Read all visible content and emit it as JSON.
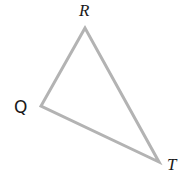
{
  "diagram": {
    "type": "triangle",
    "stroke_color": "#b3b3b3",
    "stroke_width": 3,
    "vertices": [
      {
        "name": "R",
        "x": 85,
        "y": 28
      },
      {
        "name": "Q",
        "x": 41,
        "y": 106
      },
      {
        "name": "T",
        "x": 159,
        "y": 162
      }
    ],
    "labels": {
      "R": "R",
      "Q": "Q",
      "T": "T"
    },
    "points_attr": "85,28 41,106 159,162"
  }
}
